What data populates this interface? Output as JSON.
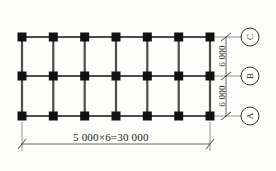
{
  "drawing": {
    "title": "structural-column-grid-plan",
    "line_color": "#1a1a1a",
    "column_fill": "#111111",
    "beam_color": "#4d4d4d",
    "dimension_color": "#555555",
    "geometry": {
      "column_columns": 7,
      "column_rows": 3,
      "grid_left_x": 22,
      "grid_right_x": 210,
      "row_y": [
        37,
        76,
        116
      ],
      "column_size_px": 9,
      "h_dim_line_y": 144,
      "v_dim_line_x": 226,
      "axis_circle_x": 250,
      "axis_circle_r": 9
    }
  },
  "dimensions": {
    "horizontal": {
      "label": "5 000×6=30 000",
      "bay_width": "5 000",
      "bay_count": "6",
      "total": "30 000"
    },
    "vertical": [
      {
        "id": "bay-upper",
        "label": "6 000"
      },
      {
        "id": "bay-lower",
        "label": "6 000"
      }
    ]
  },
  "axis_markers": [
    {
      "id": "axis-c",
      "label": "C",
      "y": 37
    },
    {
      "id": "axis-b",
      "label": "B",
      "y": 76
    },
    {
      "id": "axis-a",
      "label": "A",
      "y": 116
    }
  ]
}
